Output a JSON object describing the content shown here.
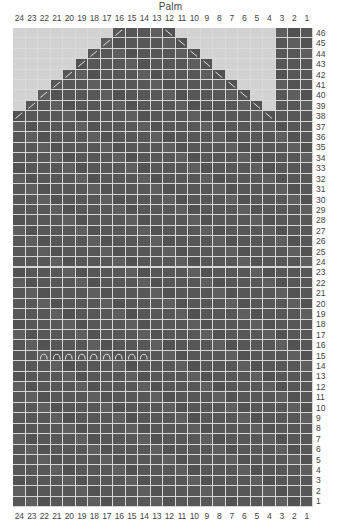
{
  "chart": {
    "title": "Palm",
    "columns": 24,
    "rows": 46,
    "column_labels": [
      "24",
      "23",
      "22",
      "21",
      "20",
      "19",
      "18",
      "17",
      "16",
      "15",
      "14",
      "13",
      "12",
      "11",
      "10",
      "9",
      "8",
      "7",
      "6",
      "5",
      "4",
      "3",
      "2",
      "1"
    ],
    "row_labels_top_to_bottom": [
      "46",
      "45",
      "44",
      "43",
      "42",
      "41",
      "40",
      "39",
      "38",
      "37",
      "36",
      "35",
      "34",
      "33",
      "32",
      "31",
      "30",
      "29",
      "28",
      "27",
      "26",
      "25",
      "24",
      "23",
      "22",
      "21",
      "20",
      "19",
      "18",
      "17",
      "16",
      "15",
      "14",
      "13",
      "12",
      "11",
      "10",
      "9",
      "8",
      "7",
      "6",
      "5",
      "4",
      "3",
      "2",
      "1"
    ],
    "colors": {
      "stitch": "#575757",
      "no_stitch": "#d2d2d2",
      "gridline": "#d6d6d6",
      "symbol": "#e8e8e8"
    },
    "shaping": [
      {
        "row": 46,
        "from_col": 16,
        "to_col": 12,
        "left_dec_col": 16,
        "right_dec_col": 12
      },
      {
        "row": 45,
        "from_col": 17,
        "to_col": 11,
        "left_dec_col": 17,
        "right_dec_col": 11
      },
      {
        "row": 44,
        "from_col": 18,
        "to_col": 10,
        "left_dec_col": 18,
        "right_dec_col": 10
      },
      {
        "row": 43,
        "from_col": 19,
        "to_col": 9,
        "left_dec_col": 19,
        "right_dec_col": 9
      },
      {
        "row": 42,
        "from_col": 20,
        "to_col": 8,
        "left_dec_col": 20,
        "right_dec_col": 8
      },
      {
        "row": 41,
        "from_col": 21,
        "to_col": 7,
        "left_dec_col": 21,
        "right_dec_col": 7
      },
      {
        "row": 40,
        "from_col": 22,
        "to_col": 6,
        "left_dec_col": 22,
        "right_dec_col": 6
      },
      {
        "row": 39,
        "from_col": 23,
        "to_col": 5,
        "left_dec_col": 23,
        "right_dec_col": 5
      },
      {
        "row": 38,
        "from_col": 24,
        "to_col": 4,
        "left_dec_col": 24,
        "right_dec_col": 4
      }
    ],
    "thumb_columns": {
      "from_col": 3,
      "to_col": 1,
      "rows_from": 1,
      "rows_to": 46
    },
    "full_rows": {
      "from_row": 1,
      "to_row": 37
    },
    "arc_symbols": {
      "row": 15,
      "from_col": 22,
      "to_col": 14,
      "symbol": "waste-yarn-arc"
    },
    "legend": {
      "left_decrease": "/",
      "right_decrease": "\\"
    }
  }
}
